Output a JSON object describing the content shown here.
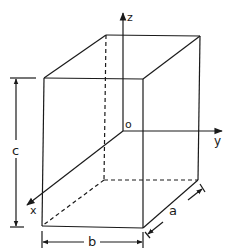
{
  "diagram": {
    "type": "rectangular-box-coordinate-system",
    "stroke_color": "#1a1a1a",
    "background": "#ffffff",
    "axes": {
      "x": {
        "label": "x"
      },
      "y": {
        "label": "y"
      },
      "z": {
        "label": "z"
      },
      "origin": {
        "label": "o"
      }
    },
    "dimensions": {
      "a": {
        "label": "a"
      },
      "b": {
        "label": "b"
      },
      "c": {
        "label": "c"
      }
    }
  }
}
